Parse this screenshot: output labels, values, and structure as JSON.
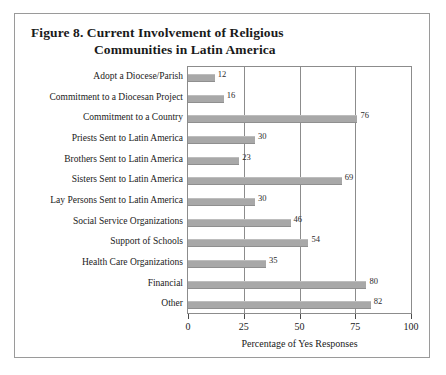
{
  "figure": {
    "title_line1": "Figure 8.  Current Involvement of Religious",
    "title_line2": "Communities in Latin America"
  },
  "chart_data": {
    "type": "bar",
    "orientation": "horizontal",
    "title": "Figure 8.  Current Involvement of Religious Communities in Latin America",
    "xlabel": "Percentage of Yes Responses",
    "ylabel": "",
    "xlim": [
      0,
      100
    ],
    "xticks": [
      "0",
      "25",
      "50",
      "75",
      "100"
    ],
    "xtick_values": [
      0,
      25,
      50,
      75,
      100
    ],
    "grid": "vertical",
    "legend": "none",
    "bar_color": "#a8a8a8",
    "categories": [
      "Adopt a Diocese/Parish",
      "Commitment to a Diocesan Project",
      "Commitment to a Country",
      "Priests Sent to Latin America",
      "Brothers Sent to Latin America",
      "Sisters Sent to Latin America",
      "Lay Persons Sent to Latin America",
      "Social Service Organizations",
      "Support of Schools",
      "Health Care Organizations",
      "Financial",
      "Other"
    ],
    "values": [
      12,
      16,
      76,
      30,
      23,
      69,
      30,
      46,
      54,
      35,
      80,
      82
    ],
    "value_labels": [
      "12",
      "16",
      "76",
      "30",
      "23",
      "69",
      "30",
      "46",
      "54",
      "35",
      "80",
      "82"
    ]
  }
}
